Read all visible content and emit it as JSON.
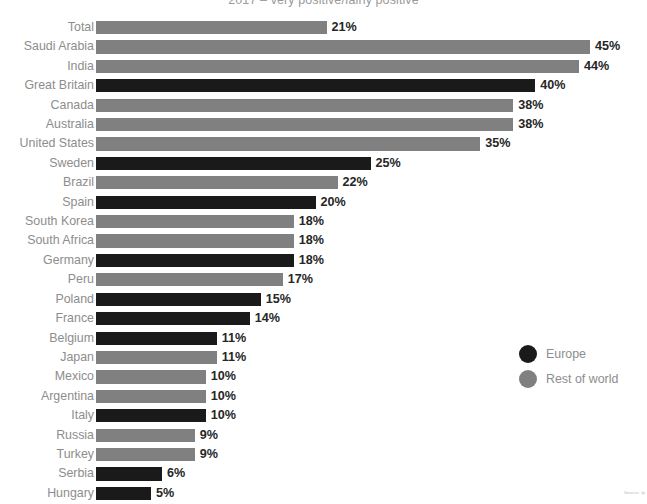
{
  "chart_data": {
    "type": "bar",
    "orientation": "horizontal",
    "title": "2017 – very positive/fairly positive",
    "xlabel": "",
    "ylabel": "",
    "xlim": [
      0,
      45
    ],
    "grid": false,
    "value_suffix": "%",
    "legend_position": "right",
    "legend": [
      {
        "name": "Europe",
        "color": "#1a1a1a"
      },
      {
        "name": "Rest of world",
        "color": "#808080"
      }
    ],
    "categories": [
      "Total",
      "Saudi Arabia",
      "India",
      "Great Britain",
      "Canada",
      "Australia",
      "United States",
      "Sweden",
      "Brazil",
      "Spain",
      "South Korea",
      "South Africa",
      "Germany",
      "Peru",
      "Poland",
      "France",
      "Belgium",
      "Japan",
      "Mexico",
      "Argentina",
      "Italy",
      "Russia",
      "Turkey",
      "Serbia",
      "Hungary"
    ],
    "values": [
      21,
      45,
      44,
      40,
      38,
      38,
      35,
      25,
      22,
      20,
      18,
      18,
      18,
      17,
      15,
      14,
      11,
      11,
      10,
      10,
      10,
      9,
      9,
      6,
      5
    ],
    "groups": [
      "Rest of world",
      "Rest of world",
      "Rest of world",
      "Europe",
      "Rest of world",
      "Rest of world",
      "Rest of world",
      "Europe",
      "Rest of world",
      "Europe",
      "Rest of world",
      "Rest of world",
      "Europe",
      "Rest of world",
      "Europe",
      "Europe",
      "Europe",
      "Rest of world",
      "Rest of world",
      "Rest of world",
      "Europe",
      "Rest of world",
      "Rest of world",
      "Europe",
      "Europe"
    ],
    "rows": [
      {
        "label": "Total",
        "value": 21,
        "display": "21%",
        "group": "Rest of world"
      },
      {
        "label": "Saudi Arabia",
        "value": 45,
        "display": "45%",
        "group": "Rest of world"
      },
      {
        "label": "India",
        "value": 44,
        "display": "44%",
        "group": "Rest of world"
      },
      {
        "label": "Great Britain",
        "value": 40,
        "display": "40%",
        "group": "Europe"
      },
      {
        "label": "Canada",
        "value": 38,
        "display": "38%",
        "group": "Rest of world"
      },
      {
        "label": "Australia",
        "value": 38,
        "display": "38%",
        "group": "Rest of world"
      },
      {
        "label": "United States",
        "value": 35,
        "display": "35%",
        "group": "Rest of world"
      },
      {
        "label": "Sweden",
        "value": 25,
        "display": "25%",
        "group": "Europe"
      },
      {
        "label": "Brazil",
        "value": 22,
        "display": "22%",
        "group": "Rest of world"
      },
      {
        "label": "Spain",
        "value": 20,
        "display": "20%",
        "group": "Europe"
      },
      {
        "label": "South Korea",
        "value": 18,
        "display": "18%",
        "group": "Rest of world"
      },
      {
        "label": "South Africa",
        "value": 18,
        "display": "18%",
        "group": "Rest of world"
      },
      {
        "label": "Germany",
        "value": 18,
        "display": "18%",
        "group": "Europe"
      },
      {
        "label": "Peru",
        "value": 17,
        "display": "17%",
        "group": "Rest of world"
      },
      {
        "label": "Poland",
        "value": 15,
        "display": "15%",
        "group": "Europe"
      },
      {
        "label": "France",
        "value": 14,
        "display": "14%",
        "group": "Europe"
      },
      {
        "label": "Belgium",
        "value": 11,
        "display": "11%",
        "group": "Europe"
      },
      {
        "label": "Japan",
        "value": 11,
        "display": "11%",
        "group": "Rest of world"
      },
      {
        "label": "Mexico",
        "value": 10,
        "display": "10%",
        "group": "Rest of world"
      },
      {
        "label": "Argentina",
        "value": 10,
        "display": "10%",
        "group": "Rest of world"
      },
      {
        "label": "Italy",
        "value": 10,
        "display": "10%",
        "group": "Europe"
      },
      {
        "label": "Russia",
        "value": 9,
        "display": "9%",
        "group": "Rest of world"
      },
      {
        "label": "Turkey",
        "value": 9,
        "display": "9%",
        "group": "Rest of world"
      },
      {
        "label": "Serbia",
        "value": 6,
        "display": "6%",
        "group": "Europe"
      },
      {
        "label": "Hungary",
        "value": 5,
        "display": "5%",
        "group": "Europe"
      }
    ]
  },
  "source_note": "Source: Ip",
  "colors": {
    "europe": "#1a1a1a",
    "rest_of_world": "#808080",
    "label_text": "#8d8d8d",
    "value_text": "#262626",
    "title_text": "#9a9a9a",
    "background": "#ffffff"
  },
  "scale": {
    "px_per_unit": 10.98,
    "bar_origin_x": 96
  }
}
